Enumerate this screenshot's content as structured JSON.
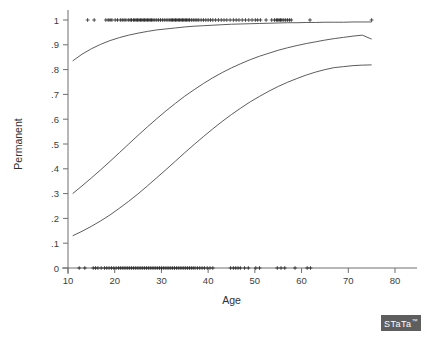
{
  "chart_data": {
    "type": "line",
    "title": "",
    "subtitle": "",
    "xlabel": "Age",
    "ylabel": "Permanent",
    "xlim": [
      10,
      80
    ],
    "ylim": [
      0,
      1
    ],
    "grid": false,
    "legend": "none",
    "x_ticks": [
      10,
      20,
      30,
      40,
      50,
      60,
      70,
      80
    ],
    "x_tick_labels": [
      "10",
      "20",
      "30",
      "40",
      "50",
      "60",
      "70",
      "80"
    ],
    "y_ticks": [
      0,
      0.1,
      0.2,
      0.3,
      0.4,
      0.5,
      0.6,
      0.7,
      0.8,
      0.9,
      1
    ],
    "y_tick_labels": [
      "0",
      ".1",
      ".2",
      ".3",
      ".4",
      ".5",
      ".6",
      ".7",
      ".8",
      ".9",
      "1"
    ],
    "series": [
      {
        "name": "upper-curve",
        "kind": "logistic-fit",
        "x": [
          11,
          13,
          15,
          17,
          19,
          21,
          23,
          25,
          27,
          29,
          31,
          33,
          35,
          37,
          39,
          41,
          43,
          45,
          47,
          49,
          51,
          53,
          55,
          57,
          59,
          61,
          63,
          65,
          67,
          69,
          71,
          73,
          75
        ],
        "values": [
          0.835,
          0.862,
          0.884,
          0.902,
          0.917,
          0.929,
          0.939,
          0.947,
          0.954,
          0.96,
          0.964,
          0.968,
          0.972,
          0.975,
          0.977,
          0.979,
          0.981,
          0.983,
          0.984,
          0.985,
          0.986,
          0.987,
          0.988,
          0.989,
          0.989,
          0.99,
          0.99,
          0.991,
          0.991,
          0.991,
          0.992,
          0.992,
          0.992
        ]
      },
      {
        "name": "middle-curve",
        "kind": "logistic-fit",
        "x": [
          11,
          13,
          15,
          17,
          19,
          21,
          23,
          25,
          27,
          29,
          31,
          33,
          35,
          37,
          39,
          41,
          43,
          45,
          47,
          49,
          51,
          53,
          55,
          57,
          59,
          61,
          63,
          65,
          67,
          69,
          71,
          73,
          75
        ],
        "values": [
          0.3,
          0.331,
          0.363,
          0.396,
          0.43,
          0.465,
          0.5,
          0.535,
          0.569,
          0.602,
          0.634,
          0.664,
          0.693,
          0.719,
          0.744,
          0.767,
          0.788,
          0.807,
          0.824,
          0.84,
          0.854,
          0.866,
          0.878,
          0.888,
          0.897,
          0.905,
          0.912,
          0.919,
          0.925,
          0.93,
          0.935,
          0.939,
          0.923
        ]
      },
      {
        "name": "lower-curve",
        "kind": "logistic-fit",
        "x": [
          11,
          13,
          15,
          17,
          19,
          21,
          23,
          25,
          27,
          29,
          31,
          33,
          35,
          37,
          39,
          41,
          43,
          45,
          47,
          49,
          51,
          53,
          55,
          57,
          59,
          61,
          63,
          65,
          67,
          69,
          71,
          73,
          75
        ],
        "values": [
          0.13,
          0.148,
          0.168,
          0.19,
          0.214,
          0.241,
          0.269,
          0.299,
          0.331,
          0.364,
          0.397,
          0.431,
          0.465,
          0.498,
          0.53,
          0.561,
          0.591,
          0.619,
          0.645,
          0.67,
          0.692,
          0.713,
          0.732,
          0.749,
          0.764,
          0.778,
          0.79,
          0.8,
          0.808,
          0.812,
          0.816,
          0.818,
          0.819
        ]
      },
      {
        "name": "observed-permanent",
        "kind": "scatter",
        "marker": "plus",
        "y_value": 1,
        "x": [
          14.2,
          15.6,
          18.1,
          18.6,
          19.0,
          19.4,
          20.1,
          20.6,
          21.2,
          21.6,
          22.0,
          22.4,
          22.9,
          23.3,
          23.6,
          24.0,
          24.3,
          24.6,
          24.9,
          25.2,
          25.5,
          25.8,
          26.1,
          26.4,
          26.7,
          27.0,
          27.3,
          27.6,
          27.9,
          28.2,
          28.6,
          29.0,
          29.4,
          29.8,
          30.2,
          30.6,
          31.0,
          31.4,
          31.8,
          32.1,
          32.4,
          32.7,
          33.0,
          33.3,
          33.6,
          33.9,
          34.2,
          34.5,
          34.8,
          35.1,
          35.4,
          35.7,
          36.0,
          36.4,
          36.8,
          37.2,
          37.6,
          38.0,
          38.5,
          39.0,
          39.5,
          40.0,
          40.5,
          41.0,
          41.6,
          42.2,
          42.8,
          43.4,
          44.0,
          44.7,
          45.4,
          46.0,
          46.6,
          47.3,
          48.0,
          48.7,
          49.4,
          50.1,
          50.6,
          51.2,
          52.4,
          53.6,
          54.2,
          54.6,
          54.9,
          55.2,
          55.5,
          55.8,
          56.2,
          56.6,
          57.0,
          57.4,
          57.8,
          61.8,
          75.0
        ]
      },
      {
        "name": "observed-not-permanent",
        "kind": "scatter",
        "marker": "plus",
        "y_value": 0,
        "x": [
          12.4,
          13.6,
          15.4,
          15.9,
          16.4,
          17.1,
          17.8,
          18.3,
          18.8,
          19.3,
          19.8,
          20.3,
          20.8,
          21.2,
          21.6,
          22.0,
          22.4,
          22.8,
          23.2,
          23.6,
          24.0,
          24.4,
          24.8,
          25.2,
          25.6,
          26.0,
          26.4,
          26.8,
          27.2,
          27.6,
          28.0,
          28.4,
          28.8,
          29.2,
          29.6,
          30.0,
          30.4,
          30.8,
          31.2,
          31.6,
          32.0,
          32.4,
          32.8,
          33.2,
          33.6,
          34.0,
          34.4,
          34.8,
          35.2,
          35.6,
          36.0,
          36.4,
          36.8,
          37.2,
          37.7,
          38.2,
          38.7,
          39.2,
          39.8,
          40.4,
          41.0,
          44.8,
          45.4,
          45.9,
          46.4,
          46.9,
          47.8,
          48.6,
          50.2,
          51.0,
          54.8,
          55.6,
          56.4,
          58.6,
          61.2,
          61.9
        ]
      }
    ],
    "annotations": []
  },
  "branding": {
    "logo_text": "STaTa",
    "trademark": "™"
  },
  "icons": {
    "marker_glyph": "+"
  }
}
